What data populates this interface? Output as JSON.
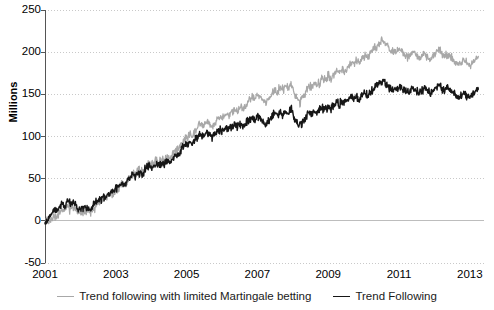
{
  "chart_data": {
    "type": "line",
    "title": "",
    "xlabel": "",
    "ylabel": "Millions",
    "xlim": [
      2001,
      2013.4
    ],
    "ylim": [
      -50,
      250
    ],
    "xticks": [
      "2001",
      "2003",
      "2005",
      "2007",
      "2009",
      "2011",
      "2013"
    ],
    "xtick_values": [
      2001,
      2003,
      2005,
      2007,
      2009,
      2011,
      2013
    ],
    "yticks": [
      "-50",
      "0",
      "50",
      "100",
      "150",
      "200",
      "250"
    ],
    "ytick_values": [
      -50,
      0,
      50,
      100,
      150,
      200,
      250
    ],
    "grid": "horizontal-dotted",
    "zero_line": true,
    "legend_position": "bottom-center",
    "series": [
      {
        "name": "Trend following with limited Martingale betting",
        "color": "#a8a8a8",
        "x": [
          2001.0,
          2001.08,
          2001.16,
          2001.24,
          2001.32,
          2001.4,
          2001.48,
          2001.56,
          2001.64,
          2001.72,
          2001.8,
          2001.88,
          2001.96,
          2002.04,
          2002.12,
          2002.2,
          2002.28,
          2002.36,
          2002.44,
          2002.52,
          2002.6,
          2002.68,
          2002.76,
          2002.84,
          2002.92,
          2003.0,
          2003.08,
          2003.16,
          2003.24,
          2003.32,
          2003.4,
          2003.48,
          2003.56,
          2003.64,
          2003.72,
          2003.8,
          2003.88,
          2003.96,
          2004.04,
          2004.12,
          2004.2,
          2004.28,
          2004.36,
          2004.44,
          2004.52,
          2004.6,
          2004.68,
          2004.76,
          2004.84,
          2004.92,
          2005.0,
          2005.08,
          2005.16,
          2005.24,
          2005.32,
          2005.4,
          2005.48,
          2005.56,
          2005.64,
          2005.72,
          2005.8,
          2005.88,
          2005.96,
          2006.04,
          2006.12,
          2006.2,
          2006.28,
          2006.36,
          2006.44,
          2006.52,
          2006.6,
          2006.68,
          2006.76,
          2006.84,
          2006.92,
          2007.0,
          2007.08,
          2007.16,
          2007.24,
          2007.32,
          2007.4,
          2007.48,
          2007.56,
          2007.64,
          2007.72,
          2007.8,
          2007.88,
          2007.96,
          2008.04,
          2008.12,
          2008.2,
          2008.28,
          2008.36,
          2008.44,
          2008.52,
          2008.6,
          2008.68,
          2008.76,
          2008.84,
          2008.92,
          2009.0,
          2009.08,
          2009.16,
          2009.24,
          2009.32,
          2009.4,
          2009.48,
          2009.56,
          2009.64,
          2009.72,
          2009.8,
          2009.88,
          2009.96,
          2010.04,
          2010.12,
          2010.2,
          2010.28,
          2010.36,
          2010.44,
          2010.52,
          2010.6,
          2010.68,
          2010.76,
          2010.84,
          2010.92,
          2011.0,
          2011.08,
          2011.16,
          2011.24,
          2011.32,
          2011.4,
          2011.48,
          2011.56,
          2011.64,
          2011.72,
          2011.8,
          2011.88,
          2011.96,
          2012.04,
          2012.12,
          2012.2,
          2012.28,
          2012.36,
          2012.44,
          2012.52,
          2012.6,
          2012.68,
          2012.76,
          2012.84,
          2012.92,
          2013.0,
          2013.08,
          2013.16,
          2013.24
        ],
        "values": [
          0,
          -2,
          2,
          6,
          4,
          10,
          14,
          12,
          17,
          13,
          16,
          12,
          10,
          9,
          12,
          11,
          10,
          13,
          17,
          20,
          24,
          22,
          28,
          33,
          30,
          36,
          40,
          44,
          41,
          47,
          52,
          57,
          54,
          60,
          57,
          62,
          66,
          70,
          67,
          72,
          69,
          74,
          71,
          76,
          73,
          78,
          82,
          86,
          90,
          94,
          98,
          103,
          100,
          106,
          111,
          115,
          112,
          118,
          114,
          110,
          115,
          120,
          124,
          121,
          127,
          124,
          129,
          133,
          130,
          136,
          132,
          138,
          143,
          147,
          144,
          150,
          147,
          143,
          139,
          145,
          150,
          156,
          152,
          158,
          155,
          161,
          157,
          163,
          152,
          146,
          140,
          147,
          153,
          160,
          157,
          164,
          159,
          165,
          170,
          167,
          172,
          168,
          174,
          179,
          176,
          181,
          177,
          183,
          188,
          185,
          190,
          187,
          192,
          196,
          193,
          198,
          202,
          206,
          210,
          214,
          211,
          207,
          203,
          199,
          202,
          206,
          202,
          198,
          194,
          197,
          200,
          196,
          193,
          196,
          199,
          195,
          192,
          196,
          199,
          202,
          198,
          195,
          198,
          194,
          191,
          188,
          185,
          188,
          191,
          187,
          184,
          188,
          192,
          195
        ]
      },
      {
        "name": "Trend Following",
        "color": "#161616",
        "x": [
          2001.0,
          2001.08,
          2001.16,
          2001.24,
          2001.32,
          2001.4,
          2001.48,
          2001.56,
          2001.64,
          2001.72,
          2001.8,
          2001.88,
          2001.96,
          2002.04,
          2002.12,
          2002.2,
          2002.28,
          2002.36,
          2002.44,
          2002.52,
          2002.6,
          2002.68,
          2002.76,
          2002.84,
          2002.92,
          2003.0,
          2003.08,
          2003.16,
          2003.24,
          2003.32,
          2003.4,
          2003.48,
          2003.56,
          2003.64,
          2003.72,
          2003.8,
          2003.88,
          2003.96,
          2004.04,
          2004.12,
          2004.2,
          2004.28,
          2004.36,
          2004.44,
          2004.52,
          2004.6,
          2004.68,
          2004.76,
          2004.84,
          2004.92,
          2005.0,
          2005.08,
          2005.16,
          2005.24,
          2005.32,
          2005.4,
          2005.48,
          2005.56,
          2005.64,
          2005.72,
          2005.8,
          2005.88,
          2005.96,
          2006.04,
          2006.12,
          2006.2,
          2006.28,
          2006.36,
          2006.44,
          2006.52,
          2006.6,
          2006.68,
          2006.76,
          2006.84,
          2006.92,
          2007.0,
          2007.08,
          2007.16,
          2007.24,
          2007.32,
          2007.4,
          2007.48,
          2007.56,
          2007.64,
          2007.72,
          2007.8,
          2007.88,
          2007.96,
          2008.04,
          2008.12,
          2008.2,
          2008.28,
          2008.36,
          2008.44,
          2008.52,
          2008.6,
          2008.68,
          2008.76,
          2008.84,
          2008.92,
          2009.0,
          2009.08,
          2009.16,
          2009.24,
          2009.32,
          2009.4,
          2009.48,
          2009.56,
          2009.64,
          2009.72,
          2009.8,
          2009.88,
          2009.96,
          2010.04,
          2010.12,
          2010.2,
          2010.28,
          2010.36,
          2010.44,
          2010.52,
          2010.6,
          2010.68,
          2010.76,
          2010.84,
          2010.92,
          2011.0,
          2011.08,
          2011.16,
          2011.24,
          2011.32,
          2011.4,
          2011.48,
          2011.56,
          2011.64,
          2011.72,
          2011.8,
          2011.88,
          2011.96,
          2012.04,
          2012.12,
          2012.2,
          2012.28,
          2012.36,
          2012.44,
          2012.52,
          2012.6,
          2012.68,
          2012.76,
          2012.84,
          2012.92,
          2013.0,
          2013.08,
          2013.16,
          2013.24
        ],
        "values": [
          0,
          3,
          8,
          13,
          10,
          16,
          21,
          18,
          24,
          19,
          22,
          18,
          15,
          13,
          17,
          15,
          14,
          18,
          22,
          25,
          28,
          26,
          31,
          35,
          32,
          38,
          42,
          45,
          42,
          48,
          52,
          56,
          53,
          58,
          55,
          59,
          63,
          66,
          63,
          68,
          65,
          69,
          66,
          71,
          68,
          73,
          77,
          80,
          84,
          88,
          91,
          95,
          92,
          97,
          101,
          104,
          101,
          106,
          102,
          98,
          102,
          106,
          109,
          106,
          110,
          107,
          111,
          114,
          111,
          115,
          112,
          116,
          120,
          123,
          120,
          125,
          122,
          118,
          114,
          119,
          123,
          127,
          124,
          129,
          126,
          130,
          127,
          132,
          122,
          117,
          112,
          118,
          123,
          128,
          125,
          130,
          126,
          131,
          135,
          132,
          136,
          133,
          137,
          141,
          138,
          142,
          139,
          143,
          147,
          144,
          148,
          145,
          149,
          152,
          149,
          153,
          156,
          159,
          162,
          165,
          163,
          160,
          157,
          154,
          157,
          160,
          157,
          154,
          151,
          154,
          157,
          154,
          151,
          154,
          157,
          154,
          151,
          155,
          158,
          161,
          158,
          155,
          158,
          155,
          152,
          149,
          146,
          149,
          152,
          149,
          146,
          150,
          153,
          156
        ]
      }
    ]
  },
  "axis": {
    "y_title": "Millions"
  },
  "legend": {
    "items": [
      {
        "label": "Trend following with limited Martingale betting",
        "color": "#a8a8a8"
      },
      {
        "label": "Trend Following",
        "color": "#161616"
      }
    ]
  }
}
